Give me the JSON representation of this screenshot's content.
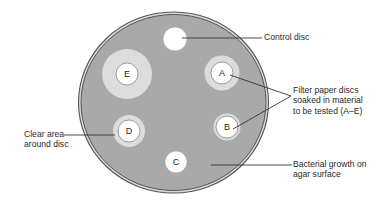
{
  "figure": {
    "type": "disc diffusion assay on agar plate",
    "colors": {
      "background": "#ffffff",
      "plate_fill": "#a9a9a9",
      "plate_rim": "#555555",
      "clear_zone": "#dcdcdc",
      "disc_fill": "#ffffff",
      "line": "#333333",
      "text": "#2a2a2a"
    },
    "discs": [
      {
        "id": "control",
        "letter": ""
      },
      {
        "id": "A",
        "letter": "A"
      },
      {
        "id": "B",
        "letter": "B"
      },
      {
        "id": "C",
        "letter": "C"
      },
      {
        "id": "D",
        "letter": "D"
      },
      {
        "id": "E",
        "letter": "E"
      }
    ],
    "labels": {
      "control": "Control disc",
      "filter_line1": "Filter paper discs",
      "filter_line2": "soaked in material",
      "filter_line3": "to be tested (A–E)",
      "clear_line1": "Clear area",
      "clear_line2": "around disc",
      "growth_line1": "Bacterial growth on",
      "growth_line2": "agar surface"
    }
  }
}
